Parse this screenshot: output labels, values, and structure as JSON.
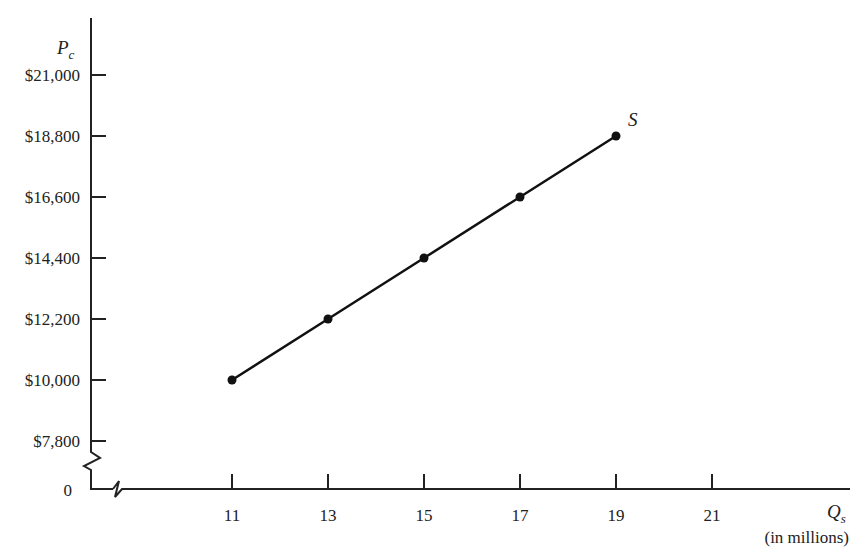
{
  "chart_data": {
    "type": "line",
    "title": "",
    "series": [
      {
        "name": "S",
        "x": [
          11,
          13,
          15,
          17,
          19
        ],
        "values": [
          10000,
          12200,
          14400,
          16600,
          18800
        ]
      }
    ],
    "xlabel": "Q_s",
    "xlabel_main": "Q",
    "xlabel_sub": "s",
    "xlabel_unit": "(in millions)",
    "ylabel": "P_c",
    "ylabel_main": "P",
    "ylabel_sub": "c",
    "x_ticks": [
      "11",
      "13",
      "15",
      "17",
      "19",
      "21"
    ],
    "y_ticks": [
      "$7,800",
      "$10,000",
      "$12,200",
      "$14,400",
      "$16,600",
      "$18,800",
      "$21,000"
    ],
    "origin_label": "0",
    "xlim": [
      9,
      23
    ],
    "ylim": [
      0,
      22000
    ],
    "axis_breaks": true,
    "grid": false,
    "legend": null,
    "annotations": [
      {
        "text": "S",
        "at": [
          19,
          18800
        ]
      }
    ]
  }
}
